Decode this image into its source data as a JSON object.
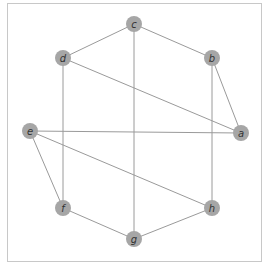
{
  "diagram": {
    "type": "undirected-graph",
    "frame": {
      "x": 7.5,
      "y": 3.5,
      "width": 254,
      "height": 258
    },
    "node_radius": 8,
    "colors": {
      "node": "#a6a6a6",
      "edge": "#9a9a9a",
      "label": "#333333",
      "frame": "#c8c8c8"
    },
    "nodes": [
      {
        "id": "a",
        "label": "a",
        "x": 241,
        "y": 133
      },
      {
        "id": "b",
        "label": "b",
        "x": 212,
        "y": 58
      },
      {
        "id": "c",
        "label": "c",
        "x": 134,
        "y": 24
      },
      {
        "id": "d",
        "label": "d",
        "x": 63,
        "y": 58
      },
      {
        "id": "e",
        "label": "e",
        "x": 30,
        "y": 131
      },
      {
        "id": "f",
        "label": "f",
        "x": 63,
        "y": 208
      },
      {
        "id": "g",
        "label": "g",
        "x": 134,
        "y": 239
      },
      {
        "id": "h",
        "label": "h",
        "x": 212,
        "y": 208
      }
    ],
    "edges": [
      {
        "from": "c",
        "to": "d"
      },
      {
        "from": "c",
        "to": "b"
      },
      {
        "from": "c",
        "to": "g"
      },
      {
        "from": "d",
        "to": "a"
      },
      {
        "from": "d",
        "to": "f"
      },
      {
        "from": "b",
        "to": "a"
      },
      {
        "from": "b",
        "to": "h"
      },
      {
        "from": "e",
        "to": "a"
      },
      {
        "from": "e",
        "to": "h"
      },
      {
        "from": "e",
        "to": "f"
      },
      {
        "from": "f",
        "to": "g"
      },
      {
        "from": "g",
        "to": "h"
      }
    ]
  }
}
